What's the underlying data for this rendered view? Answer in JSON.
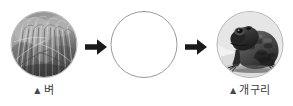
{
  "diagram": {
    "type": "food-chain-sequence",
    "background_color": "#ffffff",
    "stages": [
      {
        "id": "rice",
        "caption_marker": "▲",
        "caption_label": "벼",
        "image_kind": "photo",
        "image_subject": "rice-plants-field",
        "image_tone": "grayscale",
        "filled": true
      },
      {
        "id": "blank",
        "caption_marker": "",
        "caption_label": "",
        "image_kind": "empty-circle",
        "image_subject": "blank-answer-placeholder",
        "image_tone": "white",
        "filled": false
      },
      {
        "id": "frog",
        "caption_marker": "▲",
        "caption_label": "개구리",
        "image_kind": "photo",
        "image_subject": "frog",
        "image_tone": "grayscale",
        "filled": true
      }
    ],
    "connectors": [
      {
        "id": "arrow-1",
        "glyph": "→",
        "direction": "right",
        "color": "#1a1a1a"
      },
      {
        "id": "arrow-2",
        "glyph": "→",
        "direction": "right",
        "color": "#1a1a1a"
      }
    ],
    "colors": {
      "caption_text": "#3a3a3a",
      "circle_outline": "#9a9a9a",
      "photo_border": "#b9b9b9",
      "arrow": "#1a1a1a"
    }
  }
}
